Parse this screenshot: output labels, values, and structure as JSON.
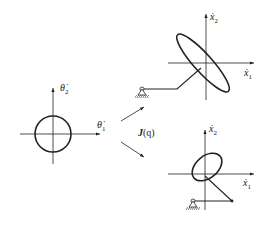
{
  "figure": {
    "joint_space": {
      "x_axis_label": "θ̇",
      "x_axis_sub": "1",
      "y_axis_label": "θ̇",
      "y_axis_sub": "2",
      "shape": "circle"
    },
    "mapping_label_bold": "J",
    "mapping_label_arg": "(q)",
    "task_space_top": {
      "x_axis_label": "ẋ",
      "x_axis_sub": "1",
      "y_axis_label": "ẋ",
      "y_axis_sub": "2",
      "shape": "elongated tilted ellipse"
    },
    "task_space_bottom": {
      "x_axis_label": "ẋ",
      "x_axis_sub": "1",
      "y_axis_label": "ẋ",
      "y_axis_sub": "2",
      "shape": "rounder tilted ellipse"
    },
    "colors": {
      "stroke": "#222222",
      "background": "#ffffff"
    }
  }
}
